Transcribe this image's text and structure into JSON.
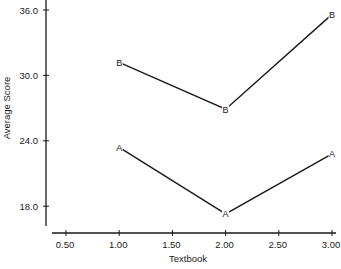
{
  "chart_data": {
    "type": "line",
    "title": "",
    "xlabel": "Textbook",
    "ylabel": "Average Score",
    "x_ticks": [
      "0.50",
      "1.00",
      "1.50",
      "2.00",
      "2.50",
      "3.00"
    ],
    "y_ticks": [
      "18.0",
      "24.0",
      "30.0",
      "36.0"
    ],
    "xlim": [
      0.4,
      3.1
    ],
    "ylim": [
      16.0,
      36.5
    ],
    "grid": false,
    "legend": "none (series marked with letters A and B)",
    "x": [
      1,
      2,
      3
    ],
    "series": [
      {
        "name": "B",
        "marker": "B",
        "values": [
          31.2,
          26.9,
          35.6
        ]
      },
      {
        "name": "A",
        "marker": "A",
        "values": [
          23.4,
          17.3,
          22.8
        ]
      }
    ]
  },
  "colors": {
    "ink": "#1a1a1a",
    "background": "#ffffff"
  }
}
